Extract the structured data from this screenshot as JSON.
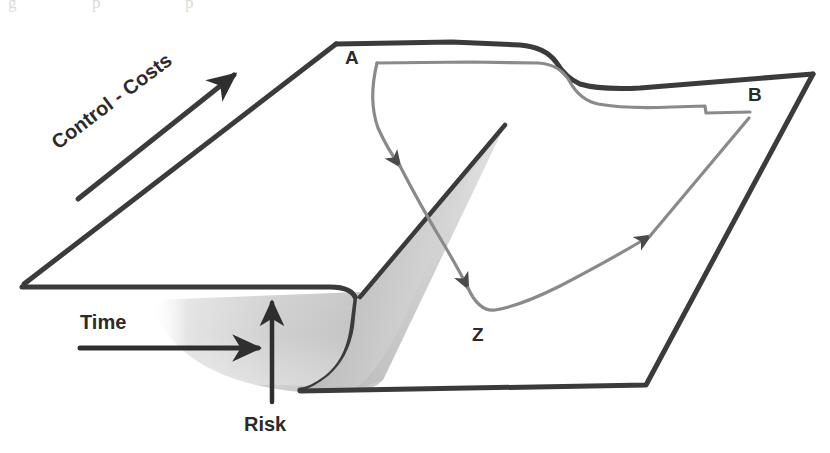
{
  "figure": {
    "kind": "cusp-catastrophe-surface-diagram",
    "width": 830,
    "height": 453,
    "background_color": "#ffffff"
  },
  "colors": {
    "edge_dark": "#3b3b3b",
    "edge_darker": "#2b2b2b",
    "trajectory_grey": "#8a8a8a",
    "fold_shade_light": "#d9d9d9",
    "fold_shade_mid": "#c2c2c2",
    "fold_shade_dark": "#a8a8a8",
    "label_text": "#2b2b2b",
    "ghost_text": "#bbbbbb"
  },
  "labels": {
    "corner_a": "A",
    "corner_b": "B",
    "point_z": "Z"
  },
  "axes": {
    "control_costs": {
      "label": "Control - Costs",
      "direction": "up-right",
      "rotation_deg": -37
    },
    "time": {
      "label": "Time",
      "direction": "right"
    },
    "risk": {
      "label": "Risk",
      "direction": "up"
    }
  },
  "ghost_line": {
    "text": "g p p"
  }
}
